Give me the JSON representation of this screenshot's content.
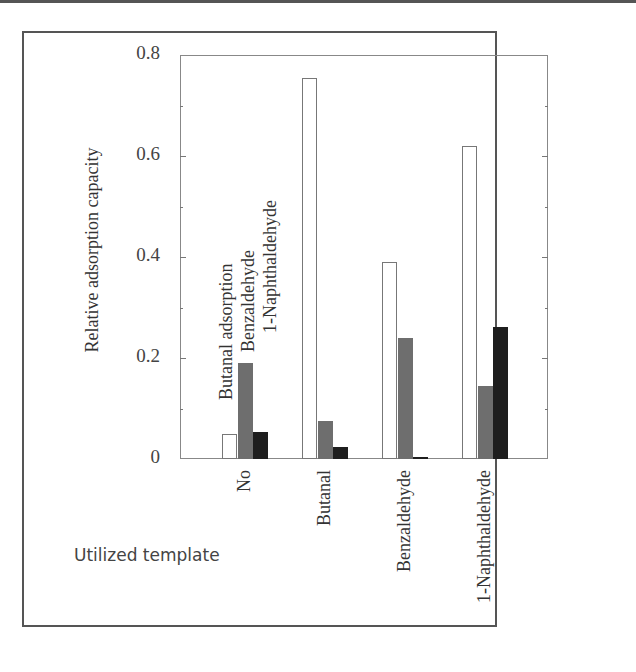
{
  "chart_data": {
    "type": "bar",
    "title": "",
    "xlabel": "Utilized template",
    "ylabel": "Relative adsorption capacity",
    "ylim": [
      0,
      0.8
    ],
    "yticks": [
      "0",
      "0.2",
      "0.4",
      "0.6",
      "0.8"
    ],
    "grid": false,
    "legend_position": "inline rotated labels above first group",
    "categories": [
      "No",
      "Butanal",
      "Benzaldehyde",
      "1-Naphthaldehyde"
    ],
    "series": [
      {
        "name": "Butanal adsorption",
        "color": "#ffffff",
        "values": [
          0.05,
          0.755,
          0.39,
          0.62
        ]
      },
      {
        "name": "Benzaldehyde",
        "color": "#6e6e6e",
        "values": [
          0.19,
          0.075,
          0.24,
          0.145
        ]
      },
      {
        "name": "1-Naphthaldehyde",
        "color": "#1e1e1e",
        "values": [
          0.053,
          0.024,
          0.003,
          0.262
        ]
      }
    ]
  }
}
